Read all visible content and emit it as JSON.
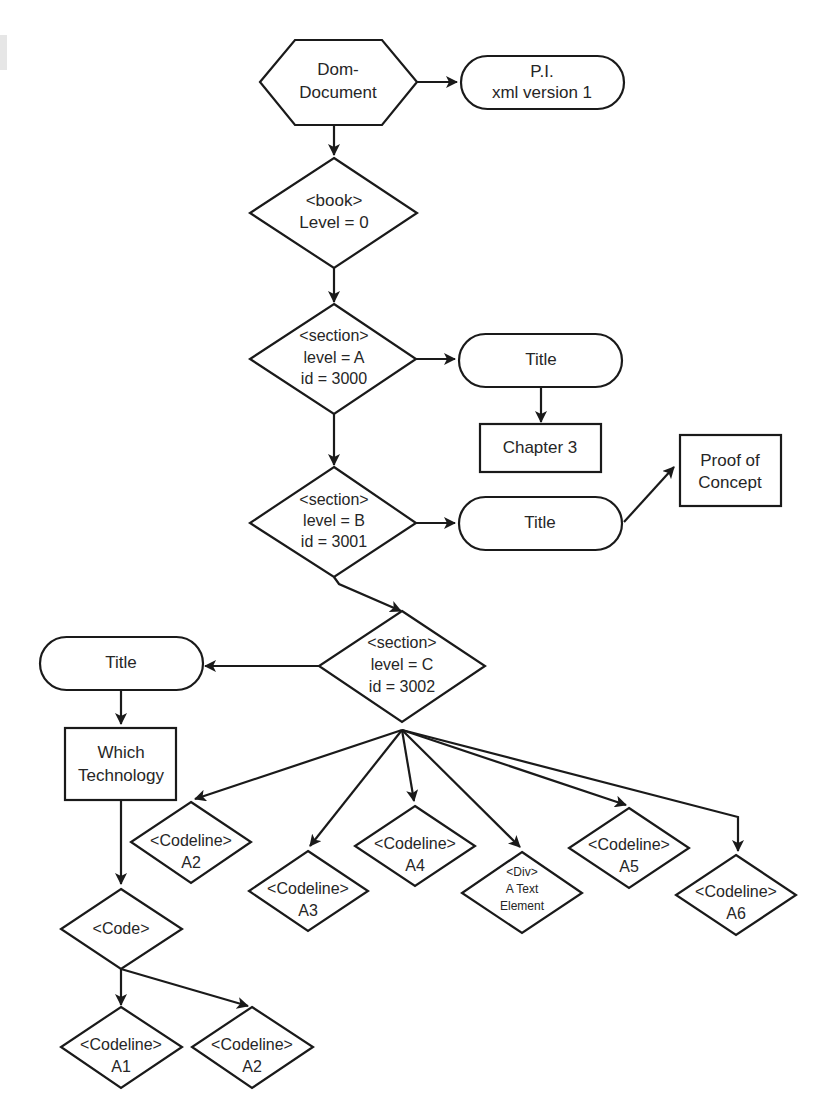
{
  "diagram": {
    "type": "flowchart",
    "colors": {
      "stroke": "#1a1a1a",
      "text": "#262626",
      "fill": "#ffffff"
    },
    "nodes": {
      "dom_document": {
        "shape": "hexagon",
        "lines": [
          "Dom-",
          "Document"
        ]
      },
      "pi": {
        "shape": "terminator",
        "lines": [
          "P.I.",
          "xml version 1"
        ]
      },
      "book": {
        "shape": "diamond",
        "lines": [
          "<book>",
          "Level = 0"
        ]
      },
      "section_a": {
        "shape": "diamond",
        "lines": [
          "<section>",
          "level = A",
          "id = 3000"
        ]
      },
      "title_a": {
        "shape": "terminator",
        "lines": [
          "Title"
        ]
      },
      "chapter3": {
        "shape": "rect",
        "lines": [
          "Chapter 3"
        ]
      },
      "section_b": {
        "shape": "diamond",
        "lines": [
          "<section>",
          "level = B",
          "id = 3001"
        ]
      },
      "title_b": {
        "shape": "terminator",
        "lines": [
          "Title"
        ]
      },
      "proof": {
        "shape": "rect",
        "lines": [
          "Proof of",
          "Concept"
        ]
      },
      "section_c": {
        "shape": "diamond",
        "lines": [
          "<section>",
          "level = C",
          "id = 3002"
        ]
      },
      "title_c": {
        "shape": "terminator",
        "lines": [
          "Title"
        ]
      },
      "which_tech": {
        "shape": "rect",
        "lines": [
          "Which",
          "Technology"
        ]
      },
      "code": {
        "shape": "diamond",
        "lines": [
          "<Code>"
        ]
      },
      "codeline_a1": {
        "shape": "diamond",
        "lines": [
          "<Codeline>",
          "A1"
        ]
      },
      "codeline_a2_code": {
        "shape": "diamond",
        "lines": [
          "<Codeline>",
          "A2"
        ]
      },
      "codeline_a2": {
        "shape": "diamond",
        "lines": [
          "<Codeline>",
          "A2"
        ]
      },
      "codeline_a3": {
        "shape": "diamond",
        "lines": [
          "<Codeline>",
          "A3"
        ]
      },
      "codeline_a4": {
        "shape": "diamond",
        "lines": [
          "<Codeline>",
          "A4"
        ]
      },
      "div_text": {
        "shape": "diamond",
        "lines": [
          "<Div>",
          "A Text",
          "Element"
        ]
      },
      "codeline_a5": {
        "shape": "diamond",
        "lines": [
          "<Codeline>",
          "A5"
        ]
      },
      "codeline_a6": {
        "shape": "diamond",
        "lines": [
          "<Codeline>",
          "A6"
        ]
      }
    },
    "edges": [
      [
        "dom_document",
        "pi"
      ],
      [
        "dom_document",
        "book"
      ],
      [
        "book",
        "section_a"
      ],
      [
        "section_a",
        "title_a"
      ],
      [
        "title_a",
        "chapter3"
      ],
      [
        "section_a",
        "section_b"
      ],
      [
        "section_b",
        "title_b"
      ],
      [
        "title_b",
        "proof"
      ],
      [
        "section_b",
        "section_c"
      ],
      [
        "section_c",
        "title_c"
      ],
      [
        "title_c",
        "which_tech"
      ],
      [
        "which_tech",
        "code"
      ],
      [
        "code",
        "codeline_a1"
      ],
      [
        "code",
        "codeline_a2_code"
      ],
      [
        "section_c",
        "codeline_a2"
      ],
      [
        "section_c",
        "codeline_a3"
      ],
      [
        "section_c",
        "codeline_a4"
      ],
      [
        "section_c",
        "div_text"
      ],
      [
        "section_c",
        "codeline_a5"
      ],
      [
        "section_c",
        "codeline_a6"
      ]
    ]
  }
}
